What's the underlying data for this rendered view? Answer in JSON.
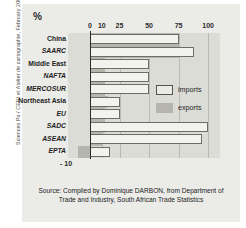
{
  "figure": {
    "percent_label": "%",
    "credit": "Sciences Po / CERI et Atelier de cartographie, February 2008",
    "source_line1": "Source: Compiled by Dominique DARBON, from Department of",
    "source_line2": "Trade and Industry, South African Trade Statistics",
    "negative_tick": "- 10"
  },
  "legend": {
    "imports_label": "imports",
    "exports_label": "exports",
    "imports_color": "#f2f2ee",
    "exports_color": "#b5b5ae"
  },
  "colors": {
    "panel": "#ebebe8",
    "plot": "#dcdcd6",
    "grid": "#b9b9b2",
    "axis": "#2b2b2b",
    "text": "#1d1d1d"
  },
  "chart_data": {
    "type": "bar",
    "orientation": "horizontal",
    "title": "",
    "xlabel": "%",
    "ylabel": "",
    "xlim": [
      -12,
      105
    ],
    "xticks": [
      0,
      10,
      25,
      50,
      75,
      100
    ],
    "xticklabels": [
      "0",
      "10",
      "25",
      "50",
      "75",
      "100"
    ],
    "grid": true,
    "legend_position": "inside-right",
    "categories": [
      "China",
      "SAARC",
      "Middle East",
      "NAFTA",
      "MERCOSUR",
      "Northeast Asia",
      "EU",
      "SADC",
      "ASEAN",
      "EPTA"
    ],
    "category_styles": [
      "bold",
      "bold-italic",
      "bold",
      "bold-italic",
      "bold-italic",
      "bold",
      "bold-italic",
      "bold-italic",
      "bold-italic",
      "bold-italic"
    ],
    "series": [
      {
        "name": "imports",
        "values": [
          75,
          88,
          50,
          50,
          50,
          25,
          25,
          100,
          95,
          17
        ]
      },
      {
        "name": "exports",
        "values": [
          75,
          75,
          13,
          13,
          13,
          15,
          13,
          13,
          10,
          -10
        ]
      }
    ]
  }
}
